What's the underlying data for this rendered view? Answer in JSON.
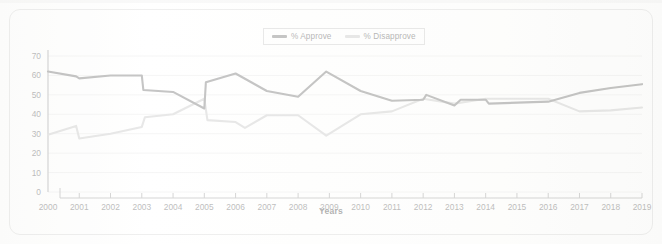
{
  "chart_data": {
    "type": "line",
    "title": "",
    "xlabel": "Years",
    "ylabel": "",
    "ylim": [
      0,
      70
    ],
    "ytick_step": 10,
    "yticks": [
      0,
      10,
      20,
      30,
      40,
      50,
      60,
      70
    ],
    "grid": true,
    "legend_position": "top-center",
    "categories": [
      "2000",
      "2001",
      "2002",
      "2003",
      "2004",
      "2005",
      "2006",
      "2007",
      "2008",
      "2009",
      "2010",
      "2011",
      "2012",
      "2013",
      "2014",
      "2015",
      "2016",
      "2017",
      "2018",
      "2019"
    ],
    "series": [
      {
        "name": "% Approve",
        "color": "#6f6f6f",
        "values": [
          62,
          58.5,
          60,
          60,
          51.5,
          43,
          61,
          52,
          49,
          62,
          52,
          47,
          50,
          44.5,
          47.5,
          45.5,
          46.5,
          51,
          53.5,
          55.5
        ]
      },
      {
        "name": "% Disapprove",
        "color": "#c6c6c6",
        "values": [
          29.5,
          27.5,
          30,
          33.5,
          40,
          48,
          33,
          39.5,
          39.5,
          29,
          40,
          41.5,
          48,
          45.5,
          48,
          48,
          48,
          41.5,
          42,
          43.5
        ]
      }
    ],
    "series_detail_approve": [
      {
        "x": 2000,
        "y": 62
      },
      {
        "x": 2000.9,
        "y": 59.5
      },
      {
        "x": 2001,
        "y": 58.5
      },
      {
        "x": 2002,
        "y": 60
      },
      {
        "x": 2003,
        "y": 60
      },
      {
        "x": 2003.05,
        "y": 52.5
      },
      {
        "x": 2004,
        "y": 51.5
      },
      {
        "x": 2005,
        "y": 43
      },
      {
        "x": 2005.05,
        "y": 56.5
      },
      {
        "x": 2006,
        "y": 61
      },
      {
        "x": 2007,
        "y": 52
      },
      {
        "x": 2008,
        "y": 49
      },
      {
        "x": 2008.9,
        "y": 62
      },
      {
        "x": 2010,
        "y": 52
      },
      {
        "x": 2011,
        "y": 47
      },
      {
        "x": 2012,
        "y": 47.5
      },
      {
        "x": 2012.1,
        "y": 50
      },
      {
        "x": 2013,
        "y": 44.5
      },
      {
        "x": 2013.2,
        "y": 47.5
      },
      {
        "x": 2014,
        "y": 47.5
      },
      {
        "x": 2014.1,
        "y": 45.5
      },
      {
        "x": 2016,
        "y": 46.5
      },
      {
        "x": 2017,
        "y": 51
      },
      {
        "x": 2018,
        "y": 53.5
      },
      {
        "x": 2019,
        "y": 55.5
      }
    ],
    "series_detail_disapprove": [
      {
        "x": 2000,
        "y": 29.5
      },
      {
        "x": 2000.9,
        "y": 34
      },
      {
        "x": 2001,
        "y": 27.5
      },
      {
        "x": 2002,
        "y": 30
      },
      {
        "x": 2003,
        "y": 33.5
      },
      {
        "x": 2003.1,
        "y": 38.5
      },
      {
        "x": 2004,
        "y": 40
      },
      {
        "x": 2005,
        "y": 48
      },
      {
        "x": 2005.1,
        "y": 37
      },
      {
        "x": 2006,
        "y": 36
      },
      {
        "x": 2006.3,
        "y": 33
      },
      {
        "x": 2007,
        "y": 39.5
      },
      {
        "x": 2007.2,
        "y": 39.5
      },
      {
        "x": 2008,
        "y": 39.5
      },
      {
        "x": 2008.9,
        "y": 29
      },
      {
        "x": 2010,
        "y": 40
      },
      {
        "x": 2011,
        "y": 41.5
      },
      {
        "x": 2012,
        "y": 48
      },
      {
        "x": 2013,
        "y": 45.5
      },
      {
        "x": 2014,
        "y": 48
      },
      {
        "x": 2016,
        "y": 48
      },
      {
        "x": 2017,
        "y": 41.5
      },
      {
        "x": 2018,
        "y": 42
      },
      {
        "x": 2019,
        "y": 43.5
      }
    ]
  },
  "legend": {
    "entries": [
      {
        "label": "% Approve",
        "color": "#6f6f6f"
      },
      {
        "label": "% Disapprove",
        "color": "#c6c6c6"
      }
    ]
  },
  "axes": {
    "x_title": "Years",
    "y_tick_labels": [
      "70",
      "60",
      "50",
      "40",
      "30",
      "20",
      "10",
      "0"
    ],
    "x_tick_labels": [
      "2000",
      "2001",
      "2002",
      "2003",
      "2004",
      "2005",
      "2006",
      "2007",
      "2008",
      "2009",
      "2010",
      "2011",
      "2012",
      "2013",
      "2014",
      "2015",
      "2016",
      "2017",
      "2018",
      "2019"
    ]
  },
  "colors": {
    "approve": "#6f6f6f",
    "disapprove": "#c6c6c6",
    "grid": "#e8e8e8",
    "axis": "#9a9a9a",
    "card_border": "#d7d7d7",
    "text": "#5c5c5c"
  }
}
